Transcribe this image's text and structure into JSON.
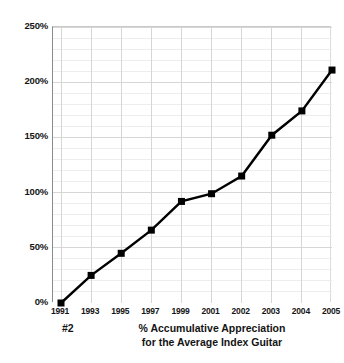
{
  "chart_data": {
    "type": "line",
    "title": "% Accumulative Appreciation for the Average Index Guitar",
    "figure_number": "#2",
    "xlabel": "",
    "ylabel": "",
    "categories": [
      "1991",
      "1993",
      "1995",
      "1997",
      "1999",
      "2001",
      "2002",
      "2003",
      "2004",
      "2005"
    ],
    "values": [
      0,
      25,
      45,
      66,
      92,
      99,
      115,
      152,
      174,
      211
    ],
    "ylim": [
      0,
      250
    ],
    "xlim_index": [
      0,
      9
    ],
    "ytick_labels": [
      "0%",
      "50%",
      "100%",
      "150%",
      "200%",
      "250%"
    ],
    "ytick_values": [
      0,
      50,
      100,
      150,
      200,
      250
    ],
    "yminor_step": 10,
    "grid": true,
    "grid_color": "#d6d6d6",
    "minor_grid_color": "#ededed",
    "legend": "none",
    "series": [
      {
        "name": "% Accumulative Appreciation",
        "values": [
          0,
          25,
          45,
          66,
          92,
          99,
          115,
          152,
          174,
          211
        ],
        "line_color": "#000000",
        "marker": "square",
        "marker_color": "#000000"
      }
    ]
  },
  "caption": {
    "number": "#2",
    "line1": "% Accumulative Appreciation",
    "line2": "for the Average Index Guitar"
  },
  "colors": {
    "background": "#ffffff",
    "ink": "#141414",
    "line": "#000000",
    "grid": "#d6d6d6",
    "minor_grid": "#ededed",
    "axis": "#8a8a8a"
  }
}
